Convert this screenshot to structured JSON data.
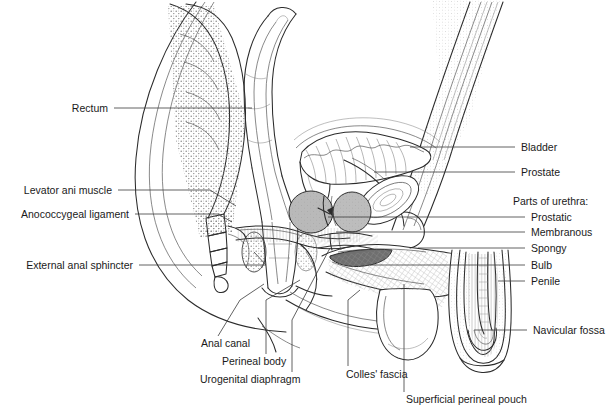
{
  "figure": {
    "background": "#ffffff",
    "line_color": "#2b2b2b",
    "label_color": "#1a1a1a"
  },
  "labels_left": [
    {
      "id": "rectum",
      "text": "Rectum",
      "x": 108,
      "y": 108
    },
    {
      "id": "levator-ani-muscle",
      "text": "Levator ani muscle",
      "x": 112,
      "y": 190
    },
    {
      "id": "anococcygeal-ligament",
      "text": "Anococcygeal ligament",
      "x": 129,
      "y": 214
    },
    {
      "id": "external-anal-sphincter",
      "text": "External anal sphincter",
      "x": 133,
      "y": 265
    }
  ],
  "labels_right": [
    {
      "id": "bladder",
      "text": "Bladder",
      "x": 521,
      "y": 147
    },
    {
      "id": "prostate",
      "text": "Prostate",
      "x": 521,
      "y": 172
    },
    {
      "id": "navicular-fossa",
      "text": "Navicular fossa",
      "x": 533,
      "y": 330
    }
  ],
  "urethra_group": {
    "heading": {
      "id": "parts-of-urethra",
      "text": "Parts of urethra:",
      "x": 513,
      "y": 201
    },
    "items": [
      {
        "id": "prostatic",
        "text": "Prostatic",
        "x": 531,
        "y": 217
      },
      {
        "id": "membranous",
        "text": "Membranous",
        "x": 531,
        "y": 232
      },
      {
        "id": "spongy",
        "text": "Spongy",
        "x": 531,
        "y": 248
      },
      {
        "id": "bulb",
        "text": "Bulb",
        "x": 531,
        "y": 265
      },
      {
        "id": "penile",
        "text": "Penile",
        "x": 531,
        "y": 281
      }
    ]
  },
  "labels_bottom": [
    {
      "id": "anal-canal",
      "text": "Anal canal",
      "x": 201,
      "y": 343,
      "align": "left"
    },
    {
      "id": "perineal-body",
      "text": "Perineal body",
      "x": 222,
      "y": 361,
      "align": "left"
    },
    {
      "id": "urogenital-diaphragm",
      "text": "Urogenital diaphragm",
      "x": 200,
      "y": 379,
      "align": "left"
    },
    {
      "id": "colles-fascia",
      "text": "Colles' fascia",
      "x": 346,
      "y": 374,
      "align": "left"
    },
    {
      "id": "superficial-perineal-pouch",
      "text": "Superficial perineal pouch",
      "x": 406,
      "y": 399,
      "align": "left"
    }
  ]
}
